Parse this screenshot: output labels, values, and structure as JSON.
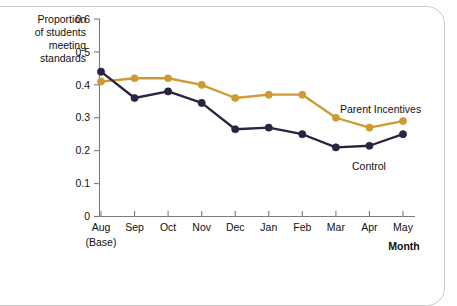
{
  "chart_data": {
    "type": "line",
    "title": "",
    "xlabel": "Month",
    "ylabel": "Proportion of students meeting standards",
    "ylabel_lines": [
      "Proportion",
      "of students",
      "meeting",
      "standards"
    ],
    "categories": [
      "Aug",
      "Sep",
      "Oct",
      "Nov",
      "Dec",
      "Jan",
      "Feb",
      "Mar",
      "Apr",
      "May"
    ],
    "category_sublabels": [
      "(Base)",
      "",
      "",
      "",
      "",
      "",
      "",
      "",
      "",
      ""
    ],
    "ylim": [
      0,
      0.6
    ],
    "yticks": [
      0,
      0.1,
      0.2,
      0.3,
      0.4,
      0.5,
      0.6
    ],
    "ytick_labels": [
      "0",
      "0.1",
      "0.2",
      "0.3",
      "0.4",
      "0.5",
      "0.6"
    ],
    "grid": false,
    "legend_position": "inline-annotation",
    "series": [
      {
        "name": "Parent Incentives",
        "color": "#CE9B33",
        "values": [
          0.41,
          0.42,
          0.42,
          0.4,
          0.36,
          0.37,
          0.37,
          0.3,
          0.27,
          0.29
        ]
      },
      {
        "name": "Control",
        "color": "#2B2342",
        "values": [
          0.44,
          0.36,
          0.38,
          0.345,
          0.265,
          0.27,
          0.25,
          0.21,
          0.215,
          0.25
        ]
      }
    ],
    "annotations": [
      {
        "text": "Parent Incentives",
        "series": "Parent Incentives"
      },
      {
        "text": "Control",
        "series": "Control"
      }
    ]
  }
}
